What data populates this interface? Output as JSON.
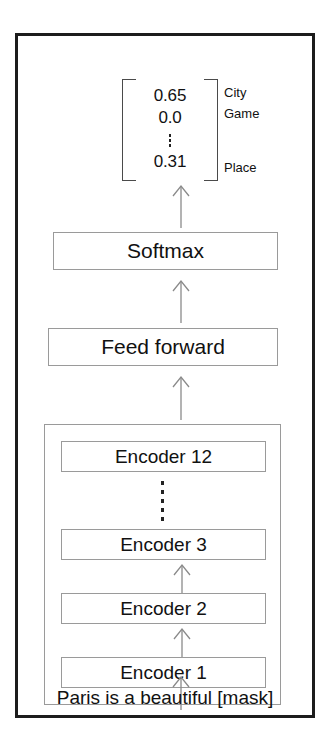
{
  "diagram": {
    "output_vector": {
      "values": [
        "0.65",
        "0.0",
        "0.31"
      ],
      "ellipsis": "vertical-dots",
      "labels": [
        "City",
        "Game",
        "Place"
      ]
    },
    "nodes": {
      "softmax": "Softmax",
      "feed_forward": "Feed forward"
    },
    "encoder_stack": {
      "encoder_12": "Encoder 12",
      "encoder_3": "Encoder 3",
      "encoder_2": "Encoder 2",
      "encoder_1": "Encoder 1",
      "ellipsis": "vertical-dots"
    },
    "input_sentence": "Paris is a beautiful [mask]",
    "colors": {
      "frame_border": "#1c1c1c",
      "box_border": "#9a9a9a",
      "arrow": "#8a8a8a",
      "text": "#111111",
      "background": "#ffffff"
    }
  }
}
